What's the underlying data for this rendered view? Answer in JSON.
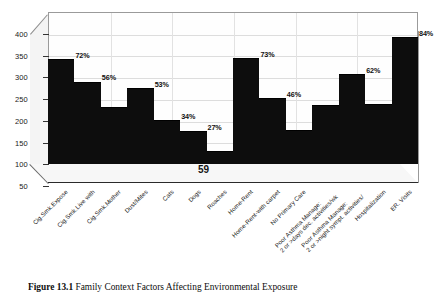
{
  "figure": {
    "caption_label": "Figure 13.1",
    "caption_text": "Family Context Factors Affecting Environmental Exposure"
  },
  "axis_note": "59",
  "chart_data": {
    "type": "bar",
    "title": "",
    "subtitle": "",
    "xlabel": "",
    "ylabel": "",
    "ylim": [
      50,
      400
    ],
    "yticks": [
      50,
      100,
      150,
      200,
      250,
      300,
      350,
      400
    ],
    "ytick_labels": [
      "50",
      "100",
      "150",
      "200",
      "250",
      "300",
      "350",
      "400"
    ],
    "grid": true,
    "legend": "none",
    "categories": [
      "Cig.Smk.Expose",
      "Cig.Smk.Live with",
      "Cig.Smk.Mother",
      "Dust/Mites",
      "Cats",
      "Dogs",
      "Roaches",
      "Home-Rent",
      "Home-Rent-with carpet",
      "No Primary Care",
      "Poor Asthma Manage: 2 or >days dec. activities/wk",
      "Poor Asthma Manage: 2 or >night sympt. activities/",
      "Hospitalization",
      "ER. Visits"
    ],
    "category_lines": [
      [
        "Cig.Smk.Expose"
      ],
      [
        "Cig.Smk.Live with"
      ],
      [
        "Cig.Smk.Mother"
      ],
      [
        "Dust/Mites"
      ],
      [
        "Cats"
      ],
      [
        "Dogs"
      ],
      [
        "Roaches"
      ],
      [
        "Home-Rent"
      ],
      [
        "Home-Rent-with carpet"
      ],
      [
        "No Primary Care"
      ],
      [
        "Poor Asthma Manage:",
        "2 or >days dec. activities/wk"
      ],
      [
        "Poor Asthma Manage:",
        "2 or >night sympt. activities/"
      ],
      [
        "Hospitalization"
      ],
      [
        "ER. Visits"
      ]
    ],
    "values": [
      291,
      240,
      182,
      224,
      152,
      127,
      80,
      293,
      202,
      128,
      187,
      258,
      188,
      342
    ],
    "data_labels": [
      "72%",
      "56%",
      "41%",
      "53%",
      "34%",
      "27%",
      "15%",
      "73%",
      "46%",
      "27%",
      "44%",
      "62%",
      "43%",
      "84%"
    ],
    "percentages": [
      72,
      56,
      41,
      53,
      34,
      27,
      15,
      73,
      46,
      27,
      44,
      62,
      43,
      84
    ],
    "bar_color": "#0d0d0d",
    "plot_background": "#fefefe"
  }
}
